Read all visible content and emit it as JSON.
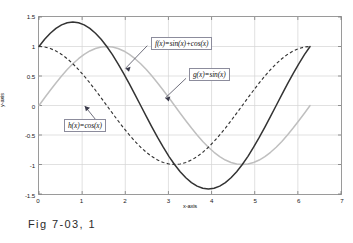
{
  "caption": "Fig 7-03, 1",
  "axes": {
    "xlabel": "x-axis",
    "ylabel": "y-axis"
  },
  "annotations": [
    {
      "name": "f-label",
      "text": "f(x)=sin(x)+cos(x)"
    },
    {
      "name": "g-label",
      "text": "g(x)=sin(x)"
    },
    {
      "name": "h-label",
      "text": "h(x)=cos(x)"
    }
  ],
  "xticklabels": [
    "0",
    "1",
    "2",
    "3",
    "4",
    "5",
    "6",
    "7"
  ],
  "yticklabels": [
    "1.5",
    "1",
    "0.5",
    "0",
    "-0.5",
    "-1",
    "-1.5"
  ],
  "colors": {
    "f_curve": "#333333",
    "g_curve": "#bfbfbf",
    "h_curve": "#333333",
    "grid": "#d4d4d4",
    "frame": "#9a9a9a",
    "box_border": "#8c8c9c"
  },
  "chart_data": {
    "type": "line",
    "title": "",
    "xlabel": "x-axis",
    "ylabel": "y-axis",
    "xlim": [
      0,
      7
    ],
    "ylim": [
      -1.5,
      1.5
    ],
    "xticks": [
      0,
      1,
      2,
      3,
      4,
      5,
      6,
      7
    ],
    "yticks": [
      -1.5,
      -1,
      -0.5,
      0,
      0.5,
      1,
      1.5
    ],
    "grid": true,
    "legend": "inline-annotations",
    "x": [
      0,
      0.1309,
      0.2618,
      0.3927,
      0.5236,
      0.6545,
      0.7854,
      0.9163,
      1.0472,
      1.1781,
      1.309,
      1.4399,
      1.5708,
      1.7017,
      1.8326,
      1.9635,
      2.0944,
      2.2253,
      2.3562,
      2.4871,
      2.618,
      2.7489,
      2.8798,
      3.0107,
      3.1416,
      3.2725,
      3.4034,
      3.5343,
      3.6652,
      3.7961,
      3.927,
      4.0579,
      4.1888,
      4.3197,
      4.4506,
      4.5815,
      4.7124,
      4.8433,
      4.9742,
      5.1051,
      5.236,
      5.3669,
      5.4978,
      5.6287,
      5.7596,
      5.8905,
      6.0214,
      6.1523,
      6.2832
    ],
    "series": [
      {
        "name": "f(x)=sin(x)+cos(x)",
        "label": "f(x)=sin(x)+cos(x)",
        "style": "solid",
        "color": "#333333",
        "values": [
          1.0,
          1.1219,
          1.2247,
          1.3066,
          1.366,
          1.4021,
          1.4142,
          1.4021,
          1.366,
          1.3066,
          1.2247,
          1.1219,
          1.0,
          0.8618,
          0.7071,
          0.5412,
          0.366,
          0.184,
          0.0,
          -0.184,
          -0.366,
          -0.5412,
          -0.7071,
          -0.8618,
          -1.0,
          -1.1219,
          -1.2247,
          -1.3066,
          -1.366,
          -1.4021,
          -1.4142,
          -1.4021,
          -1.366,
          -1.3066,
          -1.2247,
          -1.1219,
          -1.0,
          -0.8618,
          -0.7071,
          -0.5412,
          -0.366,
          -0.184,
          0.0,
          0.184,
          0.366,
          0.5412,
          0.7071,
          0.8618,
          1.0
        ]
      },
      {
        "name": "g(x)=sin(x)",
        "label": "g(x)=sin(x)",
        "style": "solid",
        "color": "#bfbfbf",
        "values": [
          0.0,
          0.1305,
          0.2588,
          0.3827,
          0.5,
          0.6088,
          0.7071,
          0.7934,
          0.866,
          0.9239,
          0.9659,
          0.9914,
          1.0,
          0.9914,
          0.9659,
          0.9239,
          0.866,
          0.7934,
          0.7071,
          0.6088,
          0.5,
          0.3827,
          0.2588,
          0.1305,
          0.0,
          -0.1305,
          -0.2588,
          -0.3827,
          -0.5,
          -0.6088,
          -0.7071,
          -0.7934,
          -0.866,
          -0.9239,
          -0.9659,
          -0.9914,
          -1.0,
          -0.9914,
          -0.9659,
          -0.9239,
          -0.866,
          -0.7934,
          -0.7071,
          -0.6088,
          -0.5,
          -0.3827,
          -0.2588,
          -0.1305,
          0.0
        ]
      },
      {
        "name": "h(x)=cos(x)",
        "label": "h(x)=cos(x)",
        "style": "dashed",
        "color": "#333333",
        "values": [
          1.0,
          0.9914,
          0.9659,
          0.9239,
          0.866,
          0.7934,
          0.7071,
          0.6088,
          0.5,
          0.3827,
          0.2588,
          0.1305,
          0.0,
          -0.1305,
          -0.2588,
          -0.3827,
          -0.5,
          -0.6088,
          -0.7071,
          -0.7934,
          -0.866,
          -0.9239,
          -0.9659,
          -0.9914,
          -1.0,
          -0.9914,
          -0.9659,
          -0.9239,
          -0.866,
          -0.7934,
          -0.7071,
          -0.6088,
          -0.5,
          -0.3827,
          -0.2588,
          -0.1305,
          0.0,
          0.1305,
          0.2588,
          0.3827,
          0.5,
          0.6088,
          0.7071,
          0.7934,
          0.866,
          0.9239,
          0.9659,
          0.9914,
          1.0
        ]
      }
    ]
  }
}
